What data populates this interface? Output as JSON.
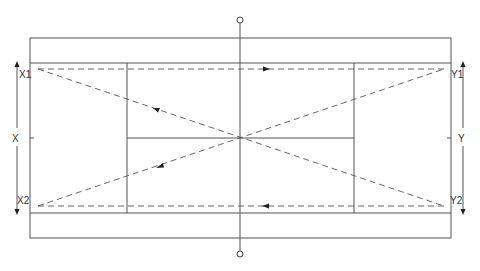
{
  "diagram": {
    "labels": {
      "left_top": "X1",
      "left_mid": "X",
      "left_bottom": "X2",
      "right_top": "Y1",
      "right_mid": "Y",
      "right_bottom": "Y2"
    },
    "elements": [
      "outer-court-boundary",
      "singles-sideline-top",
      "singles-sideline-bottom",
      "service-line-left",
      "service-line-right",
      "center-service-line",
      "net-line",
      "net-post-top",
      "net-post-bottom",
      "trajectory-top-straight",
      "trajectory-bottom-straight",
      "trajectory-diagonal-down",
      "trajectory-diagonal-up",
      "dimension-arrow-left",
      "dimension-arrow-right"
    ],
    "line_color": "#555555",
    "background": "#ffffff"
  }
}
